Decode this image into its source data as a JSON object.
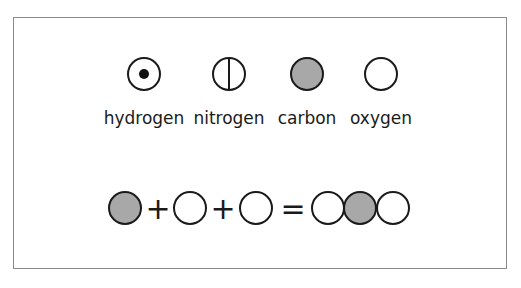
{
  "legend": [
    {
      "name": "hydrogen",
      "symbol": "circle-with-dot"
    },
    {
      "name": "nitrogen",
      "symbol": "circle-with-vertical-line"
    },
    {
      "name": "carbon",
      "symbol": "gray-filled-circle"
    },
    {
      "name": "oxygen",
      "symbol": "empty-circle"
    }
  ],
  "equation": {
    "plus_1": "+",
    "plus_2": "+",
    "equals": "=",
    "reactants": [
      "carbon",
      "oxygen",
      "oxygen"
    ],
    "product": [
      "oxygen",
      "carbon",
      "oxygen"
    ]
  },
  "colors": {
    "carbon_fill": "#a8a8a8",
    "stroke": "#1a1a1a",
    "frame": "#8a8a8a"
  }
}
